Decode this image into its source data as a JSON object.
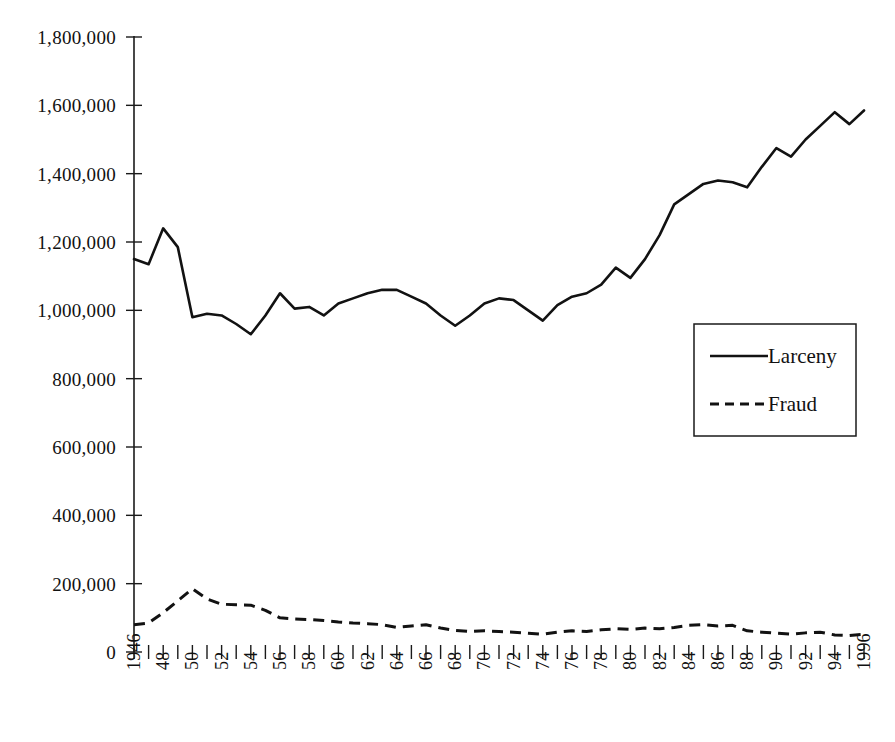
{
  "chart_data": {
    "type": "line",
    "title": "",
    "subtitle": "",
    "xlabel": "",
    "ylabel": "",
    "xlim": [
      1946,
      1996
    ],
    "ylim": [
      0,
      1800000
    ],
    "grid": false,
    "legend_position": "middle-right",
    "y_ticks": [
      0,
      200000,
      400000,
      600000,
      800000,
      1000000,
      1200000,
      1400000,
      1600000,
      1800000
    ],
    "y_tick_labels": [
      "0",
      "200,000",
      "400,000",
      "600,000",
      "800,000",
      "1,000,000",
      "1,200,000",
      "1,400,000",
      "1,600,000",
      "1,800,000"
    ],
    "x_tick_labels": [
      "1946",
      "48",
      "50",
      "52",
      "54",
      "56",
      "58",
      "60",
      "62",
      "64",
      "66",
      "68",
      "70",
      "72",
      "74",
      "76",
      "78",
      "80",
      "82",
      "84",
      "86",
      "88",
      "90",
      "92",
      "94",
      "1996"
    ],
    "x": [
      1946,
      1947,
      1948,
      1949,
      1950,
      1951,
      1952,
      1953,
      1954,
      1955,
      1956,
      1957,
      1958,
      1959,
      1960,
      1961,
      1962,
      1963,
      1964,
      1965,
      1966,
      1967,
      1968,
      1969,
      1970,
      1971,
      1972,
      1973,
      1974,
      1975,
      1976,
      1977,
      1978,
      1979,
      1980,
      1981,
      1982,
      1983,
      1984,
      1985,
      1986,
      1987,
      1988,
      1989,
      1990,
      1991,
      1992,
      1993,
      1994,
      1995,
      1996
    ],
    "series": [
      {
        "name": "Larceny",
        "style": "solid",
        "values": [
          1150000,
          1135000,
          1240000,
          1185000,
          980000,
          990000,
          985000,
          960000,
          930000,
          985000,
          1050000,
          1005000,
          1010000,
          985000,
          1020000,
          1035000,
          1050000,
          1060000,
          1060000,
          1040000,
          1020000,
          985000,
          955000,
          985000,
          1020000,
          1035000,
          1030000,
          1000000,
          970000,
          1015000,
          1040000,
          1050000,
          1075000,
          1125000,
          1095000,
          1150000,
          1220000,
          1310000,
          1340000,
          1370000,
          1380000,
          1375000,
          1360000,
          1420000,
          1475000,
          1450000,
          1500000,
          1540000,
          1580000,
          1545000,
          1585000
        ]
      },
      {
        "name": "Fraud",
        "style": "dashed",
        "values": [
          80000,
          85000,
          115000,
          150000,
          185000,
          155000,
          140000,
          138000,
          137000,
          122000,
          100000,
          97000,
          95000,
          92000,
          88000,
          85000,
          83000,
          80000,
          72000,
          76000,
          80000,
          70000,
          63000,
          60000,
          62000,
          60000,
          58000,
          55000,
          52000,
          58000,
          62000,
          60000,
          65000,
          68000,
          66000,
          70000,
          68000,
          72000,
          78000,
          80000,
          76000,
          78000,
          62000,
          58000,
          55000,
          52000,
          56000,
          58000,
          50000,
          48000,
          52000
        ]
      }
    ]
  },
  "legend": {
    "items": [
      {
        "label": "Larceny",
        "style": "solid"
      },
      {
        "label": "Fraud",
        "style": "dashed"
      }
    ]
  }
}
